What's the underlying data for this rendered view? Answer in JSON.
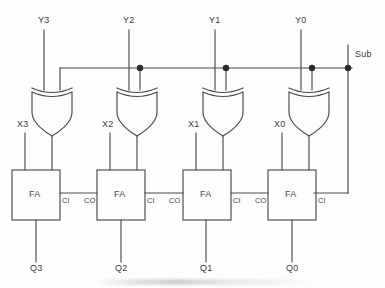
{
  "diagram": {
    "background_color": "#fdfdfd",
    "line_color": "#4a4a4a",
    "text_color": "#3a3a3a",
    "width": 385,
    "height": 288
  },
  "control": {
    "label": "Sub",
    "bus_y": 68,
    "stub_top_y": 45,
    "vertical_x": 348
  },
  "bit_slices": [
    {
      "index": 3,
      "y_input_label": "Y3",
      "x_input_label": "X3",
      "sum_output_label": "Q3",
      "gate_label": "",
      "adder_label": "FA",
      "carry_in_label": "CI",
      "carry_out_label": "",
      "x_center": 36
    },
    {
      "index": 2,
      "y_input_label": "Y2",
      "x_input_label": "X2",
      "sum_output_label": "Q2",
      "gate_label": "",
      "adder_label": "FA",
      "carry_in_label": "CI",
      "carry_out_label": "CO",
      "x_center": 121
    },
    {
      "index": 1,
      "y_input_label": "Y1",
      "x_input_label": "X1",
      "sum_output_label": "Q1",
      "gate_label": "",
      "adder_label": "FA",
      "carry_in_label": "CI",
      "carry_out_label": "CO",
      "x_center": 206
    },
    {
      "index": 0,
      "y_input_label": "Y0",
      "x_input_label": "X0",
      "sum_output_label": "Q0",
      "gate_label": "",
      "adder_label": "FA",
      "carry_in_label": "CI",
      "carry_out_label": "CO",
      "x_center": 292
    }
  ],
  "pin_labels": {
    "carry_in": "CI",
    "carry_out": "CO",
    "adder": "FA"
  },
  "junctions": [
    {
      "x": 140,
      "y": 68
    },
    {
      "x": 226,
      "y": 68
    },
    {
      "x": 312,
      "y": 68
    },
    {
      "x": 348,
      "y": 68
    }
  ]
}
